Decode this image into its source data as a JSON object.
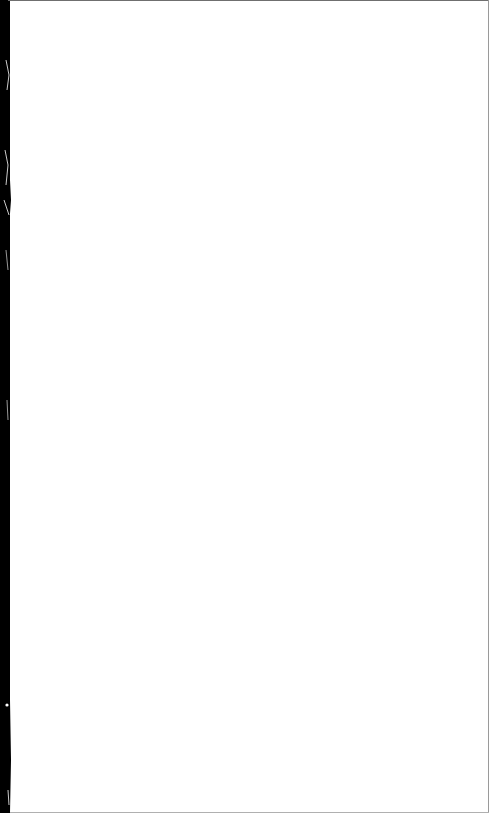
{
  "document": {
    "type": "scanned-blank-page",
    "content": "",
    "colors": {
      "paper": "#ffffff",
      "left_edge": "#000000",
      "top_border": "#6f6f6f",
      "right_border": "#9a9a9a"
    }
  }
}
